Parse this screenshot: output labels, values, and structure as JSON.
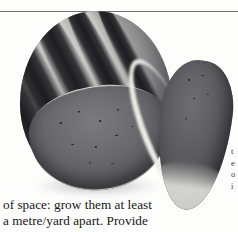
{
  "page": {
    "background_color": "#fdfdfc",
    "rule_color": "#6f6f6f"
  },
  "figure": {
    "caption_alt": "watermelon-photograph",
    "parts": {
      "whole_melon": "whole-striped-watermelon",
      "cut_face": "melon-cut-face",
      "wedge": "watermelon-wedge-slice"
    }
  },
  "body": {
    "lines": [
      "of space: grow them at least",
      "a metre/yard apart. Provide"
    ]
  },
  "edge_column": {
    "fragments": [
      "t",
      "e",
      "o",
      "i"
    ]
  }
}
